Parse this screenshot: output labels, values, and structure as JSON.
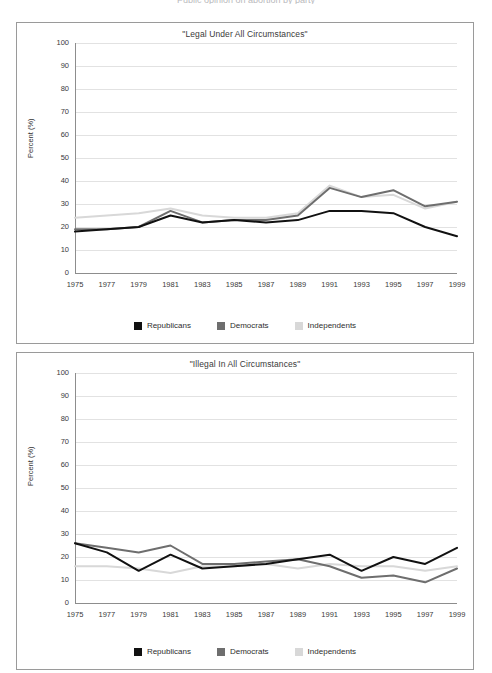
{
  "cut_header": "Public opinion on abortion by party",
  "legend": {
    "items": [
      {
        "label": "Republicans",
        "color": "#111111"
      },
      {
        "label": "Democrats",
        "color": "#6e6e6e"
      },
      {
        "label": "Independents",
        "color": "#d8d8d8"
      }
    ]
  },
  "axis": {
    "ylabel": "Percent (%)",
    "yticks": [
      "100",
      "90",
      "80",
      "70",
      "60",
      "50",
      "40",
      "30",
      "20",
      "10",
      "0"
    ],
    "xticks": [
      "1975",
      "1977",
      "1979",
      "1981",
      "1983",
      "1985",
      "1987",
      "1989",
      "1991",
      "1993",
      "1995",
      "1997",
      "1999"
    ]
  },
  "chart_data": [
    {
      "type": "line",
      "title": "\"Legal Under All Circumstances\"",
      "xlabel": "",
      "ylabel": "Percent (%)",
      "ylim": [
        0,
        100
      ],
      "grid": true,
      "legend_position": "bottom",
      "x": [
        1975,
        1977,
        1979,
        1981,
        1983,
        1985,
        1987,
        1989,
        1991,
        1993,
        1995,
        1997,
        1999
      ],
      "series": [
        {
          "name": "Republicans",
          "color": "#111111",
          "values": [
            18,
            19,
            20,
            25,
            22,
            23,
            22,
            23,
            27,
            27,
            26,
            20,
            16
          ]
        },
        {
          "name": "Democrats",
          "color": "#6e6e6e",
          "values": [
            19,
            19,
            20,
            27,
            22,
            23,
            23,
            25,
            37,
            33,
            36,
            29,
            31
          ]
        },
        {
          "name": "Independents",
          "color": "#d8d8d8",
          "values": [
            24,
            25,
            26,
            28,
            25,
            24,
            24,
            26,
            38,
            33,
            34,
            28,
            31
          ]
        }
      ]
    },
    {
      "type": "line",
      "title": "\"Illegal In All Circumstances\"",
      "xlabel": "",
      "ylabel": "Percent (%)",
      "ylim": [
        0,
        100
      ],
      "grid": true,
      "legend_position": "bottom",
      "x": [
        1975,
        1977,
        1979,
        1981,
        1983,
        1985,
        1987,
        1989,
        1991,
        1993,
        1995,
        1997,
        1999
      ],
      "series": [
        {
          "name": "Republicans",
          "color": "#111111",
          "values": [
            26,
            22,
            14,
            21,
            15,
            16,
            17,
            19,
            21,
            14,
            20,
            17,
            24
          ]
        },
        {
          "name": "Democrats",
          "color": "#6e6e6e",
          "values": [
            26,
            24,
            22,
            25,
            17,
            17,
            18,
            19,
            16,
            11,
            12,
            9,
            15
          ]
        },
        {
          "name": "Independents",
          "color": "#d8d8d8",
          "values": [
            16,
            16,
            15,
            13,
            16,
            16,
            17,
            15,
            17,
            16,
            16,
            14,
            16
          ]
        }
      ]
    }
  ]
}
